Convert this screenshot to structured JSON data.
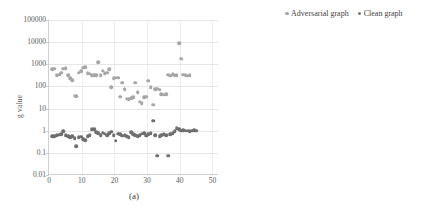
{
  "figure": {
    "panels": [
      {
        "id": "a",
        "caption": "(a)",
        "ylabel": "g value"
      },
      {
        "id": "b",
        "caption": "(b)",
        "ylabel": ""
      }
    ],
    "legend": {
      "position": "top-right-of-panel-b",
      "entries": [
        {
          "label": "Adversarial graph",
          "color": "#a6a6a6"
        },
        {
          "label": "Clean graph",
          "color": "#767676"
        }
      ]
    }
  },
  "chart_data": [
    {
      "type": "scatter",
      "panel": "(a)",
      "title": "",
      "xlabel": "",
      "ylabel": "g value",
      "yscale": "log",
      "ylim": [
        0.01,
        100000
      ],
      "yticks": [
        0.01,
        0.1,
        1,
        10,
        100,
        1000,
        10000,
        100000
      ],
      "ytick_labels": [
        "0.01",
        "0.1",
        "1",
        "10",
        "100",
        "1000",
        "10000",
        "100000"
      ],
      "xlim": [
        0,
        52
      ],
      "xticks": [
        0,
        10,
        20,
        30,
        40,
        50
      ],
      "xtick_labels": [
        "0",
        "10",
        "20",
        "30",
        "40",
        "50"
      ],
      "grid": true,
      "legend": [
        "Adversarial graph",
        "Clean graph"
      ],
      "series": [
        {
          "name": "Adversarial graph",
          "color": "#a6a6a6",
          "x": [
            1,
            1.6,
            2.4,
            3.1,
            3.8,
            4.4,
            5.1,
            5.8,
            6.4,
            7.1,
            7.8,
            8.4,
            9.1,
            9.8,
            10.4,
            11.1,
            11.8,
            12.4,
            13.1,
            13.8,
            14.4,
            15.1,
            15.8,
            16.4,
            17.1,
            17.8,
            18.4,
            19.1,
            19.8,
            20.4,
            21.1,
            21.8,
            22.4,
            23.1,
            23.8,
            24.4,
            25.1,
            25.8,
            26.4,
            27.1,
            27.8,
            28.4,
            29.1,
            29.8,
            30.4,
            31.1,
            31.8,
            32.4,
            33.1,
            33.8,
            34.4,
            35.1,
            35.8,
            36.4,
            37.1,
            37.8,
            38.4,
            39.1,
            39.8,
            40.4,
            41.1,
            41.8,
            42.4,
            43.1,
            43.8,
            44.4,
            45.1,
            45.8,
            46.4,
            47.1,
            47.8,
            48.4,
            49.1,
            49.8,
            50.4,
            51.1
          ],
          "y": [
            600,
            620,
            320,
            340,
            420,
            640,
            680,
            330,
            230,
            195,
            38,
            37,
            420,
            480,
            700,
            720,
            390,
            370,
            330,
            330,
            330,
            1250,
            330,
            520,
            400,
            420,
            610,
            95,
            230,
            250,
            250,
            35,
            150,
            75,
            28,
            26,
            30,
            32,
            145,
            55,
            20,
            17,
            33,
            35,
            180,
            90,
            15,
            75,
            80,
            70,
            45,
            42,
            45,
            340,
            300,
            360,
            330,
            320,
            9000,
            1800,
            340,
            330,
            300,
            320
          ]
        },
        {
          "name": "Clean graph",
          "color": "#6e6e6e",
          "x": [
            1,
            1.6,
            2.4,
            3.1,
            3.8,
            4.4,
            5.1,
            5.8,
            6.4,
            7.1,
            7.8,
            8.4,
            9.1,
            9.8,
            10.4,
            11.1,
            11.8,
            12.4,
            13.1,
            13.8,
            14.4,
            15.1,
            15.8,
            16.4,
            17.1,
            17.8,
            18.4,
            19.1,
            19.8,
            20.4,
            21.1,
            21.8,
            22.4,
            23.1,
            23.8,
            24.4,
            25.1,
            25.8,
            26.4,
            27.1,
            27.8,
            28.4,
            29.1,
            29.8,
            30.4,
            31.1,
            31.8,
            32.4,
            33.1,
            33.8,
            34.4,
            35.1,
            35.8,
            36.4,
            37.1,
            37.8,
            38.4,
            39.1,
            39.8,
            40.4,
            41.1,
            41.8,
            42.4,
            43.1,
            43.8,
            44.4,
            45.1,
            45.8,
            46.4,
            47.1,
            47.8,
            48.4,
            49.1,
            49.8,
            50.4,
            51.1
          ],
          "y": [
            0.55,
            0.56,
            0.62,
            0.65,
            0.7,
            0.95,
            0.62,
            0.58,
            0.5,
            0.55,
            0.45,
            0.2,
            0.52,
            0.53,
            0.42,
            0.38,
            0.55,
            0.62,
            1.15,
            1.2,
            0.85,
            0.78,
            0.62,
            0.8,
            0.72,
            0.62,
            0.75,
            0.9,
            0.62,
            0.35,
            0.72,
            0.68,
            0.6,
            0.62,
            0.55,
            0.52,
            0.85,
            0.68,
            0.62,
            0.58,
            0.62,
            0.72,
            0.78,
            0.6,
            0.7,
            0.75,
            2.8,
            0.62,
            0.075,
            0.55,
            0.62,
            0.68,
            0.62,
            0.075,
            0.7,
            0.75,
            0.95,
            1.3,
            1.2,
            1.0,
            1.05,
            1.0,
            1.0,
            0.98,
            1.0,
            1.05,
            1.0
          ]
        }
      ]
    },
    {
      "type": "scatter",
      "panel": "(b)",
      "title": "",
      "xlabel": "",
      "ylabel": "",
      "yscale": "log",
      "ylim": [
        0.001,
        10000
      ],
      "yticks": [
        0.001,
        0.01,
        0.1,
        1,
        10,
        100,
        1000,
        10000
      ],
      "ytick_labels": [
        "0.001",
        "0.01",
        "0.1",
        "1",
        "10",
        "100",
        "1000",
        "10000"
      ],
      "xlim": [
        0,
        200
      ],
      "xticks": [
        0,
        50,
        100,
        150,
        200
      ],
      "xtick_labels": [
        "0",
        "50",
        "100",
        "150",
        "200"
      ],
      "grid": true,
      "legend": [
        "Adversarial graph",
        "Clean graph"
      ],
      "series": [
        {
          "name": "Adversarial graph",
          "color": "#a6a6a6",
          "x": [
            2,
            4,
            6,
            8,
            10,
            12,
            14,
            16,
            18,
            20,
            22,
            24,
            26,
            28,
            30,
            32,
            34,
            36,
            38,
            40,
            42,
            44,
            46,
            48,
            50,
            52,
            54,
            56,
            58,
            60,
            62,
            64,
            66,
            68,
            70,
            72,
            74,
            76,
            78,
            80,
            82,
            84,
            86,
            88,
            90,
            92,
            94,
            96,
            98,
            100,
            102,
            104,
            106,
            108,
            110,
            112,
            114,
            116,
            118,
            120,
            122,
            124,
            126,
            128,
            130,
            132,
            134,
            136,
            138,
            140,
            142,
            144,
            146,
            148,
            150,
            152,
            154,
            156,
            158,
            160,
            162,
            164,
            166,
            168,
            170,
            172,
            174,
            176,
            178,
            180
          ],
          "y": [
            130,
            120,
            160,
            200,
            300,
            140,
            130,
            120,
            150,
            180,
            400,
            160,
            130,
            120,
            110,
            150,
            130,
            120,
            160,
            170,
            130,
            120,
            150,
            140,
            1200,
            130,
            120,
            110,
            160,
            140,
            300,
            120,
            110,
            2000,
            90,
            60,
            45,
            30,
            25,
            1500,
            1900,
            80,
            75,
            70,
            320,
            330,
            330,
            330,
            330,
            330,
            330,
            330,
            330,
            110,
            95,
            90,
            13,
            900,
            700,
            1000,
            300,
            350,
            400,
            330,
            300,
            280,
            300,
            320,
            340,
            300,
            1500,
            1450,
            320,
            300,
            280,
            300,
            330,
            350,
            950,
            300,
            280,
            260,
            300,
            320,
            300,
            280,
            300,
            310,
            290,
            300
          ]
        },
        {
          "name": "Clean graph",
          "color": "#6e6e6e",
          "x": [
            2,
            4,
            6,
            8,
            10,
            12,
            14,
            16,
            18,
            20,
            22,
            24,
            26,
            28,
            30,
            32,
            34,
            36,
            38,
            40,
            42,
            44,
            46,
            48,
            50,
            52,
            54,
            56,
            58,
            60,
            62,
            64,
            66,
            68,
            70,
            72,
            74,
            76,
            78,
            80,
            82,
            84,
            86,
            88,
            90,
            92,
            94,
            96,
            98,
            100,
            102,
            104,
            106,
            108,
            110,
            112,
            114,
            116,
            118,
            120,
            122,
            124,
            126,
            128,
            130,
            132,
            134,
            136,
            138,
            140,
            142,
            144,
            146,
            148,
            150,
            152,
            154,
            156,
            158,
            160,
            162,
            164,
            166,
            168,
            170,
            172,
            174,
            176,
            178,
            180
          ],
          "y": [
            0.55,
            0.04,
            0.035,
            0.5,
            0.3,
            0.2,
            0.12,
            0.9,
            0.35,
            0.9,
            0.06,
            0.015,
            0.2,
            0.25,
            0.3,
            0.2,
            0.15,
            0.1,
            0.06,
            0.05,
            0.3,
            0.25,
            0.4,
            0.2,
            0.1,
            0.08,
            0.5,
            0.06,
            0.3,
            0.25,
            0.35,
            0.2,
            0.02,
            0.1,
            0.28,
            0.3,
            0.2,
            0.35,
            0.05,
            0.06,
            0.3,
            0.2,
            0.15,
            0.1,
            0.7,
            0.75,
            0.8,
            0.7,
            0.75,
            0.8,
            0.75,
            0.5,
            0.6,
            0.3,
            0.35,
            0.25,
            0.3,
            0.2,
            0.04,
            0.35,
            0.3,
            0.25,
            0.2,
            0.3,
            0.25,
            0.2,
            0.3,
            0.15,
            0.2,
            0.25,
            0.18,
            0.2,
            0.15,
            0.2,
            0.13,
            0.15,
            0.2,
            0.12,
            0.1,
            0.15,
            0.12,
            0.1,
            0.2,
            0.3,
            0.15,
            0.1,
            0.12,
            0.1,
            0.017,
            0.007
          ]
        }
      ]
    }
  ]
}
